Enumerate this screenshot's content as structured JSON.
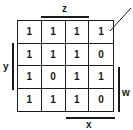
{
  "kmap": {
    "labels": {
      "top": "z",
      "left": "y",
      "right": "w",
      "bottom": "x"
    },
    "rows": [
      [
        "1",
        "1",
        "1",
        "1"
      ],
      [
        "1",
        "1",
        "1",
        "0"
      ],
      [
        "1",
        "0",
        "1",
        "1"
      ],
      [
        "1",
        "1",
        "1",
        "0"
      ]
    ]
  },
  "colors": {
    "line": "#1a1a1a",
    "background": "#ffffff"
  }
}
